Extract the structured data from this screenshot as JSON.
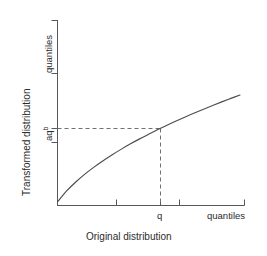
{
  "chart_data": {
    "type": "line",
    "title": "",
    "subtitle": "",
    "xlabel": "Original distribution",
    "ylabel": "Transformed distribution",
    "x_unit_label": "quantiles",
    "y_unit_label": "quantiles",
    "grid": false,
    "legend": "none",
    "xlim": [
      0,
      1
    ],
    "ylim": [
      0,
      1
    ],
    "xticks_labeled": [
      {
        "label": "q",
        "x": 0.55
      }
    ],
    "yticks_labeled": [
      {
        "label": "aq",
        "superscript": "b",
        "y": 0.415
      }
    ],
    "annotations": [
      {
        "name": "reference-lines",
        "style": "dashed",
        "from": "y-axis",
        "to": "curve-point-q"
      }
    ],
    "series": [
      {
        "name": "transform-curve",
        "shape": "concave-power",
        "description": "y = a * x^b with 0 < b < 1",
        "x": [
          0.0,
          0.05,
          0.1,
          0.15,
          0.2,
          0.25,
          0.3,
          0.35,
          0.4,
          0.45,
          0.5,
          0.55,
          0.6,
          0.65,
          0.7,
          0.75,
          0.8,
          0.85,
          0.9,
          0.95,
          1.0
        ],
        "y": [
          0.0,
          0.098,
          0.178,
          0.248,
          0.31,
          0.367,
          0.42,
          0.47,
          0.517,
          0.561,
          0.603,
          0.644,
          0.683,
          0.72,
          0.756,
          0.791,
          0.825,
          0.858,
          0.89,
          0.921,
          0.951
        ]
      }
    ],
    "marked_point": {
      "x": 0.55,
      "y": 0.644,
      "x_label": "q",
      "y_label": "aq^b"
    },
    "colors": {
      "axis": "#55585c",
      "curve": "#4a4d52",
      "dashed": "#6d7075",
      "text": "#2b2b2b",
      "background": "#ffffff"
    }
  },
  "labels": {
    "x_axis_title": "Original distribution",
    "y_axis_title": "Transformed distribution",
    "x_axis_unit": "quantiles",
    "y_axis_unit": "quantiles",
    "x_tick_q": "q",
    "y_tick_aq": "aq",
    "y_tick_aq_exponent": "b"
  }
}
